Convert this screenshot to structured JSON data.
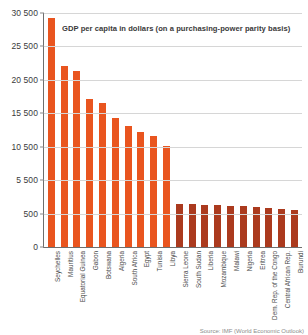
{
  "chart_data": {
    "type": "bar",
    "title": "GDP per capita in dollars (on a purchasing-power parity basis)",
    "xlabel": "",
    "ylabel": "",
    "source": "Source: IMF (World Economic Outlook)",
    "grid": true,
    "legend": "none",
    "ylim": [
      0,
      30500
    ],
    "ytick_labels": [
      "0",
      "500",
      "5 500",
      "10 500",
      "15 500",
      "20 500",
      "25 500",
      "30 500"
    ],
    "ytick_values": [
      0,
      500,
      5500,
      10500,
      15500,
      20500,
      25500,
      30500
    ],
    "bar_color_high": "#e9551f",
    "bar_color_low": "#ab3a1e",
    "categories": [
      "Seychelles",
      "Mauritius",
      "Equatorial Guinea",
      "Gabon",
      "Botswana",
      "Algeria",
      "South Africa",
      "Egypt",
      "Tunisia",
      "Libya",
      "Sierra Leone",
      "South Sudan",
      "Liberia",
      "Mozambique",
      "Malawi",
      "Nigeria",
      "Eritrea",
      "Dem. Rep. of the Congo",
      "Central African Rep.",
      "Burundi"
    ],
    "values": [
      29800,
      22600,
      21800,
      17600,
      17000,
      14800,
      13600,
      12700,
      12100,
      10600,
      2000,
      1900,
      1800,
      1750,
      1650,
      1600,
      1500,
      1400,
      1250,
      1100
    ],
    "bar_shades": [
      "high",
      "high",
      "high",
      "high",
      "high",
      "high",
      "high",
      "high",
      "high",
      "high",
      "low",
      "low",
      "low",
      "low",
      "low",
      "low",
      "low",
      "low",
      "low",
      "low"
    ]
  }
}
